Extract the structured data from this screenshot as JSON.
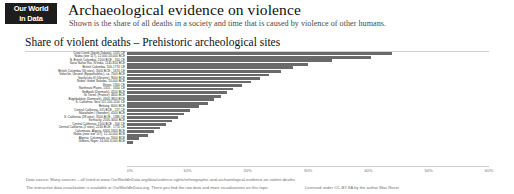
{
  "header": {
    "logo_line1": "Our World",
    "logo_line2": "in Data",
    "title": "Archaeological evidence on violence",
    "subtitle": "Shown is the share of all deaths in a society and time that is caused by violence of other humans."
  },
  "chart_title": "Share of violent deaths – Prehistoric archeological sites",
  "footer": {
    "line1": "Data source: Many sources – all listed at www.OurWorldInData.org/data/violence-rights/ethnographic-and-archaeological-evidence-on-violent-deaths",
    "line2": "The interactive data visualization is available at OurWorldInData.org. There you find the raw data and more visualizations on this topic.",
    "license": "Licensed under CC-BY-SA by the author Max Roser"
  },
  "chart_data": {
    "type": "bar",
    "orientation": "horizontal",
    "title": "Share of violent deaths – Prehistoric archeological sites",
    "xlabel": "",
    "ylabel": "",
    "xlim": [
      0,
      60
    ],
    "xticks": [
      0,
      10,
      20,
      30,
      40,
      50,
      60
    ],
    "xtick_labels": [
      "0%",
      "10%",
      "20%",
      "30%",
      "40%",
      "50%",
      "60%"
    ],
    "grid": false,
    "legend": false,
    "bar_color": "#6a6a6a",
    "categories": [
      "Crow Creek (South Dakota), 1325 CE",
      "Nubia (site 117), 12,000-10,000 BCE",
      "N. British Columbia, 1500 BCE - 500 CE",
      "Sarai Nahar Rai, N India, 1140-854 BCE",
      "British Columbia, 500-1774 CE",
      "British Columbia (30 sites), 3000 BCE - 1674 CE",
      "Volos'ke, Ukraine (Epipaleolithic), ca. 7500 BCE",
      "Vasilyi'vka III (Ukraine), 9000 BCE",
      "Nubia: Gebel Sahaba, 10,000 BCE",
      "Illinois, 1300 CE",
      "Northeast Plains, 1325 - 1650 CE",
      "Vedbaek (Denmark), 4100 BCE",
      "Ile Teviec (France), 4600 BCE",
      "Bogebakken (Denmark), 4300-3800 BCE",
      "S. California: Vero 115 100-1100 CE",
      "Brittany, 6000 BCE",
      "Central California, 415 BCE - 227 CE",
      "Skateholm I (Sweden), 4100 BCE",
      "S. California (28 sites), 3500 BCE - 1380 CE",
      "Kentucky, 2500-3000 BCE",
      "Central California, 1500 BCE - 500 CE",
      "Central California (2 sites), 2240 BCE - 1770 CE",
      "Calumnata, Algeria, 6300-5300 BCE",
      "Nubia (near site 117), 12-10,000 BCE",
      "Algeria: Columnata ca. 5500 BCE",
      "Gobero, Niger, 14,000-6,000 BCE"
    ],
    "values": [
      44.0,
      40.5,
      34.0,
      30.0,
      27.5,
      25.5,
      23.5,
      22.0,
      20.5,
      19.0,
      17.5,
      16.5,
      15.5,
      14.5,
      13.5,
      12.0,
      10.5,
      9.5,
      8.5,
      7.5,
      6.5,
      5.5,
      4.5,
      3.5,
      2.0,
      1.0
    ]
  }
}
